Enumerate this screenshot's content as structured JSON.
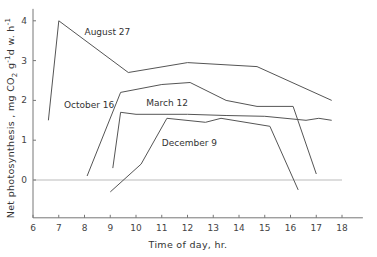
{
  "chart_data": {
    "type": "line",
    "title": "",
    "xlabel": "Time of day, hr.",
    "ylabel": "Net photosynthesis, mg CO2 g-1 d.w. h-1",
    "ylabel_parts": {
      "main": "Net  photosynthesis ,  mg CO",
      "sub1": "2",
      "mid1": " g",
      "sup1": "-1",
      "mid2": "d w. h",
      "sup2": "-1"
    },
    "xlim": [
      6,
      18.5
    ],
    "ylim": [
      -0.95,
      4.3
    ],
    "xticks": [
      6,
      7,
      8,
      9,
      10,
      11,
      12,
      13,
      14,
      15,
      16,
      17,
      18
    ],
    "yticks": [
      0,
      1,
      2,
      3,
      4
    ],
    "grid": false,
    "zero_line": true,
    "legend": "inline labels",
    "series": [
      {
        "name": "August 27",
        "label_pos": [
          8.0,
          3.65
        ],
        "points": [
          [
            6.6,
            1.5
          ],
          [
            7.0,
            4.0
          ],
          [
            9.7,
            2.7
          ],
          [
            12.0,
            2.95
          ],
          [
            14.7,
            2.85
          ],
          [
            17.6,
            2.0
          ]
        ]
      },
      {
        "name": "October 16",
        "label_pos": [
          7.2,
          1.8
        ],
        "points": [
          [
            8.1,
            0.1
          ],
          [
            9.4,
            2.2
          ],
          [
            11.0,
            2.4
          ],
          [
            12.1,
            2.45
          ],
          [
            13.5,
            2.0
          ],
          [
            14.7,
            1.85
          ],
          [
            16.1,
            1.85
          ],
          [
            17.0,
            0.15
          ]
        ]
      },
      {
        "name": "March 12",
        "label_pos": [
          10.4,
          1.85
        ],
        "points": [
          [
            9.1,
            0.3
          ],
          [
            9.4,
            1.7
          ],
          [
            10.0,
            1.65
          ],
          [
            12.0,
            1.65
          ],
          [
            13.5,
            1.62
          ],
          [
            15.0,
            1.6
          ],
          [
            16.6,
            1.5
          ],
          [
            17.1,
            1.55
          ],
          [
            17.6,
            1.5
          ]
        ]
      },
      {
        "name": "December 9",
        "label_pos": [
          11.0,
          0.85
        ],
        "points": [
          [
            9.0,
            -0.3
          ],
          [
            10.2,
            0.4
          ],
          [
            11.2,
            1.55
          ],
          [
            12.7,
            1.45
          ],
          [
            13.3,
            1.55
          ],
          [
            15.2,
            1.35
          ],
          [
            16.3,
            -0.25
          ]
        ]
      }
    ]
  }
}
